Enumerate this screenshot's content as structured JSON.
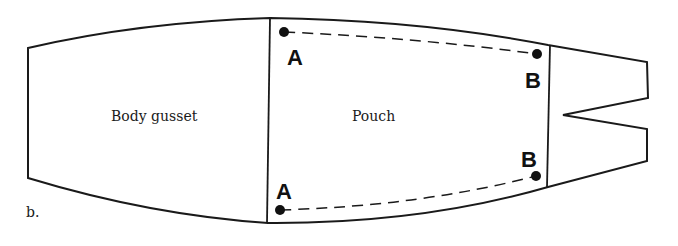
{
  "figure": {
    "label": "b.",
    "regions": [
      {
        "name": "body-gusset",
        "label": "Body gusset"
      },
      {
        "name": "pouch",
        "label": "Pouch"
      }
    ],
    "points": [
      {
        "id": "A-top",
        "label": "A"
      },
      {
        "id": "B-top",
        "label": "B"
      },
      {
        "id": "B-bottom",
        "label": "B"
      },
      {
        "id": "A-bottom",
        "label": "A"
      }
    ],
    "colors": {
      "stroke": "#1a1a1a",
      "background": "#ffffff"
    }
  }
}
